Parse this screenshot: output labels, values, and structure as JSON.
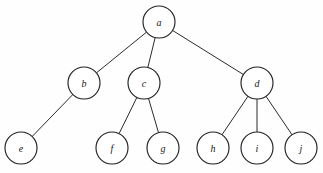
{
  "diagram": {
    "type": "rooted-tree",
    "title": "",
    "background_color": "#fefefe",
    "node_fill_color": "#ffffff",
    "node_stroke_color": "#222222",
    "edge_color": "#2b2b2b",
    "label_color": "#1a1a1a",
    "node_radius": 16,
    "canvas": {
      "width": 323,
      "height": 173
    },
    "levels": [
      {
        "index": 0,
        "y": 22,
        "nodes": [
          "a"
        ]
      },
      {
        "index": 1,
        "y": 83,
        "nodes": [
          "b",
          "c",
          "d"
        ]
      },
      {
        "index": 2,
        "y": 148,
        "nodes": [
          "e",
          "f",
          "g",
          "h",
          "i",
          "j"
        ]
      }
    ],
    "nodes": [
      {
        "id": "a",
        "label": "a",
        "x": 159,
        "y": 22,
        "r": 16,
        "level": 0
      },
      {
        "id": "b",
        "label": "b",
        "x": 84,
        "y": 83,
        "r": 16,
        "level": 1
      },
      {
        "id": "c",
        "label": "c",
        "x": 144,
        "y": 83,
        "r": 16,
        "level": 1
      },
      {
        "id": "d",
        "label": "d",
        "x": 257,
        "y": 83,
        "r": 16,
        "level": 1
      },
      {
        "id": "e",
        "label": "e",
        "x": 21,
        "y": 148,
        "r": 16,
        "level": 2
      },
      {
        "id": "f",
        "label": "f",
        "x": 112,
        "y": 148,
        "r": 16,
        "level": 2
      },
      {
        "id": "g",
        "label": "g",
        "x": 163,
        "y": 148,
        "r": 16,
        "level": 2
      },
      {
        "id": "h",
        "label": "h",
        "x": 213,
        "y": 148,
        "r": 16,
        "level": 2
      },
      {
        "id": "i",
        "label": "i",
        "x": 257,
        "y": 148,
        "r": 16,
        "level": 2
      },
      {
        "id": "j",
        "label": "j",
        "x": 301,
        "y": 148,
        "r": 16,
        "level": 2
      }
    ],
    "edges": [
      {
        "from": "a",
        "to": "b"
      },
      {
        "from": "a",
        "to": "c"
      },
      {
        "from": "a",
        "to": "d"
      },
      {
        "from": "b",
        "to": "e"
      },
      {
        "from": "c",
        "to": "f"
      },
      {
        "from": "c",
        "to": "g"
      },
      {
        "from": "d",
        "to": "h"
      },
      {
        "from": "d",
        "to": "i"
      },
      {
        "from": "d",
        "to": "j"
      }
    ]
  }
}
